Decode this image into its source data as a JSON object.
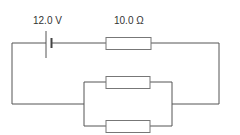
{
  "diagram": {
    "type": "circuit",
    "battery": {
      "label": "12.0 V"
    },
    "series_resistor": {
      "label": "10.0 Ω"
    },
    "parallel_resistors": [
      {
        "label": ""
      },
      {
        "label": ""
      }
    ]
  },
  "colors": {
    "wire": "#555555",
    "resistor_stroke": "#777777",
    "text": "#333333",
    "background": "#ffffff"
  }
}
